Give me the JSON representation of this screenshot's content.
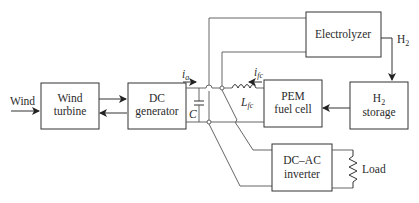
{
  "diagram": {
    "blocks": {
      "wind_turbine": {
        "line1": "Wind",
        "line2": "turbine"
      },
      "dc_generator": {
        "line1": "DC",
        "line2": "generator"
      },
      "electrolyzer": {
        "line1": "Electrolyzer"
      },
      "pem_fuel_cell": {
        "line1": "PEM",
        "line2": "fuel cell"
      },
      "h2_storage": {
        "line1": "H",
        "sub": "2",
        "line2": "storage"
      },
      "dc_ac_inverter": {
        "line1": "DC–AC",
        "line2": "inverter"
      }
    },
    "labels": {
      "wind_input": "Wind",
      "current_a": "i",
      "current_a_sub": "a",
      "capacitor": "C",
      "current_fc": "i",
      "current_fc_sub": "fc",
      "inductor": "L",
      "inductor_sub": "fc",
      "h2_flow": "H",
      "h2_flow_sub": "2",
      "load": "Load"
    },
    "colors": {
      "line": "#333333",
      "wire": "#555555",
      "text": "#2b2b2b",
      "background": "#ffffff"
    }
  }
}
